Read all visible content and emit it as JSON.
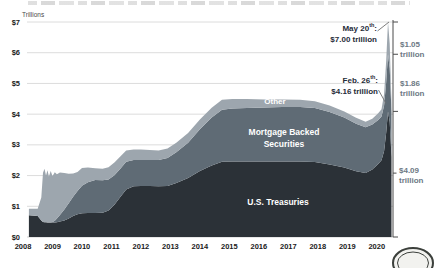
{
  "page": {
    "unit_label": "Trillions"
  },
  "overlay_labels": {
    "other": "Other",
    "mbs_line1": "Mortgage Backed",
    "mbs_line2": "Securities",
    "treasuries": "U.S. Treasuries"
  },
  "annotations": {
    "may": {
      "date": "May 20",
      "sup": "th",
      "suffix": ":",
      "value": "$7.00 trillion"
    },
    "feb": {
      "date": "Feb. 26",
      "sup": "th",
      "suffix": ":",
      "value": "$4.16 trillion"
    }
  },
  "right_labels": {
    "other": {
      "value": "$1.05",
      "unit": "trillion"
    },
    "mbs": {
      "value": "$1.86",
      "unit": "trillion"
    },
    "treasuries": {
      "value": "$4.09",
      "unit": "trillion"
    }
  },
  "chart_data": {
    "type": "area",
    "stacked": true,
    "title": "",
    "unit_label": "Trillions",
    "xlabel": "",
    "ylabel": "Trillions",
    "ylim": [
      0,
      7
    ],
    "x_ticks": [
      "2008",
      "2009",
      "2010",
      "2011",
      "2012",
      "2013",
      "2014",
      "2015",
      "2016",
      "2017",
      "2018",
      "2019",
      "2020"
    ],
    "y_ticks": [
      "$0",
      "$1",
      "$2",
      "$3",
      "$4",
      "$5",
      "$6",
      "$7"
    ],
    "grid": true,
    "legend_position": "in-plot-labels",
    "series_meta": [
      {
        "name": "U.S. Treasuries",
        "color": "#2b3137"
      },
      {
        "name": "Mortgage Backed Securities",
        "color": "#5f6b75"
      },
      {
        "name": "Other",
        "color": "#9da6ae"
      }
    ],
    "columns": [
      "year",
      "us_treasuries",
      "mbs",
      "other"
    ],
    "points": [
      [
        2008.2,
        0.71,
        0.0,
        0.21
      ],
      [
        2008.5,
        0.68,
        0.0,
        0.24
      ],
      [
        2008.62,
        0.54,
        0.0,
        0.75
      ],
      [
        2008.68,
        0.49,
        0.0,
        1.6
      ],
      [
        2008.73,
        0.48,
        0.0,
        1.74
      ],
      [
        2008.78,
        0.48,
        0.0,
        1.52
      ],
      [
        2008.83,
        0.47,
        0.0,
        1.7
      ],
      [
        2008.88,
        0.47,
        0.0,
        1.5
      ],
      [
        2008.94,
        0.47,
        0.0,
        1.68
      ],
      [
        2009.0,
        0.47,
        0.02,
        1.5
      ],
      [
        2009.08,
        0.47,
        0.06,
        1.58
      ],
      [
        2009.15,
        0.48,
        0.12,
        1.44
      ],
      [
        2009.25,
        0.5,
        0.22,
        1.38
      ],
      [
        2009.4,
        0.54,
        0.36,
        1.18
      ],
      [
        2009.55,
        0.6,
        0.5,
        0.96
      ],
      [
        2009.7,
        0.68,
        0.63,
        0.76
      ],
      [
        2009.85,
        0.74,
        0.76,
        0.62
      ],
      [
        2010.0,
        0.77,
        0.9,
        0.58
      ],
      [
        2010.2,
        0.78,
        1.0,
        0.48
      ],
      [
        2010.45,
        0.78,
        1.08,
        0.38
      ],
      [
        2010.7,
        0.79,
        1.06,
        0.37
      ],
      [
        2010.9,
        0.86,
        1.01,
        0.4
      ],
      [
        2011.1,
        1.05,
        0.96,
        0.42
      ],
      [
        2011.3,
        1.3,
        0.92,
        0.4
      ],
      [
        2011.5,
        1.55,
        0.9,
        0.37
      ],
      [
        2011.75,
        1.65,
        0.86,
        0.34
      ],
      [
        2012.0,
        1.66,
        0.85,
        0.34
      ],
      [
        2012.3,
        1.66,
        0.85,
        0.32
      ],
      [
        2012.6,
        1.65,
        0.86,
        0.31
      ],
      [
        2012.9,
        1.66,
        0.91,
        0.31
      ],
      [
        2013.2,
        1.76,
        1.0,
        0.31
      ],
      [
        2013.6,
        1.92,
        1.15,
        0.32
      ],
      [
        2014.0,
        2.15,
        1.36,
        0.32
      ],
      [
        2014.4,
        2.33,
        1.56,
        0.32
      ],
      [
        2014.75,
        2.45,
        1.69,
        0.33
      ],
      [
        2015.1,
        2.46,
        1.72,
        0.31
      ],
      [
        2015.6,
        2.46,
        1.74,
        0.29
      ],
      [
        2016.2,
        2.46,
        1.76,
        0.26
      ],
      [
        2016.8,
        2.46,
        1.77,
        0.25
      ],
      [
        2017.4,
        2.46,
        1.77,
        0.24
      ],
      [
        2017.9,
        2.44,
        1.76,
        0.22
      ],
      [
        2018.4,
        2.36,
        1.71,
        0.21
      ],
      [
        2018.9,
        2.26,
        1.63,
        0.2
      ],
      [
        2019.3,
        2.14,
        1.55,
        0.19
      ],
      [
        2019.62,
        2.08,
        1.49,
        0.18
      ],
      [
        2019.85,
        2.2,
        1.46,
        0.19
      ],
      [
        2020.05,
        2.38,
        1.43,
        0.22
      ],
      [
        2020.16,
        2.5,
        1.42,
        0.24
      ],
      [
        2020.25,
        2.8,
        1.48,
        0.38
      ],
      [
        2020.32,
        3.4,
        1.65,
        0.7
      ],
      [
        2020.38,
        4.09,
        1.86,
        1.05
      ],
      [
        2020.44,
        3.75,
        1.75,
        0.8
      ],
      [
        2020.5,
        2.6,
        1.45,
        0.3
      ]
    ],
    "key_points": [
      {
        "label": "Feb. 26th",
        "total": "$4.16 trillion"
      },
      {
        "label": "May 20th",
        "total": "$7.00 trillion"
      }
    ],
    "right_axis": {
      "tick_values": [
        7.0,
        5.95,
        4.09,
        0
      ],
      "pointer_value": 2.08,
      "segments": [
        {
          "series": "Other",
          "amount": "$1.05 trillion"
        },
        {
          "series": "Mortgage Backed Securities",
          "amount": "$1.86 trillion"
        },
        {
          "series": "U.S. Treasuries",
          "amount": "$4.09 trillion"
        }
      ]
    },
    "colors": {
      "treasuries": "#2b3137",
      "mbs": "#5f6b75",
      "other": "#9da6ae",
      "gridline": "#dcdcdc",
      "right_axis_line": "#4a4a4a",
      "annotation_text": "#1f2c39",
      "segment_label_text": "#6e7984",
      "axis_text": "#1a1a1a"
    }
  }
}
